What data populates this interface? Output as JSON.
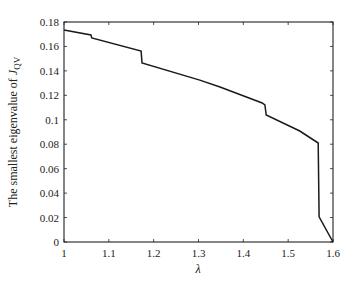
{
  "chart_data": {
    "type": "line",
    "title": "",
    "xlabel": "λ",
    "ylabel": "The smallest eigenvalue of J_QV",
    "ylabel_main": "The smallest eigenvalue of ",
    "ylabel_symbol": "J",
    "ylabel_subscript": "QV",
    "xlim": [
      1.0,
      1.6
    ],
    "ylim": [
      0,
      0.18
    ],
    "xticks": [
      1,
      1.1,
      1.2,
      1.3,
      1.4,
      1.5,
      1.6
    ],
    "xtick_labels": [
      "1",
      "1.1",
      "1.2",
      "1.3",
      "1.4",
      "1.5",
      "1.6"
    ],
    "yticks": [
      0,
      0.02,
      0.04,
      0.06,
      0.08,
      0.1,
      0.12,
      0.14,
      0.16,
      0.18
    ],
    "ytick_labels": [
      "0",
      "0.02",
      "0.04",
      "0.06",
      "0.08",
      "0.1",
      "0.12",
      "0.14",
      "0.16",
      "0.18"
    ],
    "grid": false,
    "legend": null,
    "series": [
      {
        "name": "smallest eigenvalue",
        "color": "#1a1a1a",
        "x": [
          1.0,
          1.06,
          1.062,
          1.172,
          1.174,
          1.303,
          1.348,
          1.442,
          1.448,
          1.451,
          1.526,
          1.567,
          1.569,
          1.6
        ],
        "y": [
          0.1735,
          0.1694,
          0.1669,
          0.1563,
          0.1465,
          0.1325,
          0.1268,
          0.1137,
          0.1121,
          0.1039,
          0.0908,
          0.081,
          0.0205,
          0.0
        ]
      }
    ]
  }
}
